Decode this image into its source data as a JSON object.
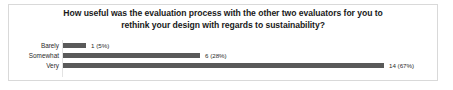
{
  "chart_data": {
    "type": "bar",
    "orientation": "horizontal",
    "title": "How useful was the evaluation process with the other two evaluators for you to rethink your design with regards to sustainability?",
    "title_lines": [
      "How useful was the evaluation process with the other two evaluators for you to",
      "rethink your design with regards to sustainability?"
    ],
    "categories": [
      "Barely",
      "Somewhat",
      "Very"
    ],
    "values": [
      1,
      6,
      14
    ],
    "percentages": [
      5,
      28,
      67
    ],
    "data_labels": [
      "1 (5%)",
      "6 (28%)",
      "14 (67%)"
    ],
    "xlabel": "",
    "ylabel": "",
    "xlim": [
      0,
      15.5
    ],
    "grid": false,
    "legend": false,
    "bar_color": "#595959",
    "axis_color": "#e3e3e3",
    "border_color": "#d9d9d9",
    "background": "#ffffff",
    "text_color": "#2b2b2b",
    "title_color": "#1a1a1a"
  }
}
